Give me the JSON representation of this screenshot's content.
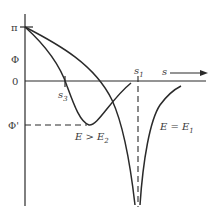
{
  "diagram": {
    "y_axis": {
      "top_label": "π",
      "label": "Φ",
      "zero_label": "0",
      "min_label": "Φ'"
    },
    "x_axis": {
      "label": "s",
      "markers": [
        {
          "name": "s1",
          "base": "s",
          "sub": "1"
        },
        {
          "name": "s3",
          "base": "s",
          "sub": "3"
        }
      ]
    },
    "curves": [
      {
        "label_main": "E > E",
        "label_sub": "2",
        "description": "curve from π dipping to minimum Φ' then rising back toward 0"
      },
      {
        "label_main": "E = E",
        "label_sub": "1",
        "description": "curve from π descending to -∞ cusp at s1 then rising symmetrically"
      }
    ],
    "colors": {
      "line": "#2a2a2a",
      "text": "#3a3a3a",
      "background": "#ffffff"
    }
  }
}
